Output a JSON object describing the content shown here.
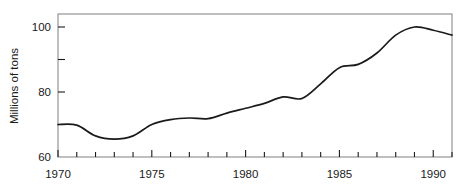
{
  "chart_data": {
    "type": "line",
    "title": "",
    "xlabel": "",
    "ylabel": "Millions of tons",
    "xlim": [
      1970,
      1991
    ],
    "ylim": [
      60,
      104
    ],
    "grid": false,
    "legend": null,
    "x_ticks_major": [
      1970,
      1975,
      1980,
      1985,
      1990
    ],
    "x_tick_labels": [
      "1970",
      "1975",
      "1980",
      "1985",
      "1990"
    ],
    "x_ticks_minor": [
      1971,
      1972,
      1973,
      1974,
      1976,
      1977,
      1978,
      1979,
      1981,
      1982,
      1983,
      1984,
      1986,
      1987,
      1988,
      1989,
      1991
    ],
    "y_ticks_major": [
      60,
      80,
      100
    ],
    "y_tick_labels": [
      "60",
      "80",
      "100"
    ],
    "y_ticks_minor": [
      70,
      90
    ],
    "series": [
      {
        "name": "tonnage",
        "x": [
          1970,
          1971,
          1972,
          1973,
          1974,
          1975,
          1976,
          1977,
          1978,
          1979,
          1980,
          1981,
          1982,
          1983,
          1984,
          1985,
          1986,
          1987,
          1988,
          1989,
          1990,
          1991
        ],
        "values": [
          70.0,
          69.8,
          66.5,
          65.5,
          66.5,
          70.0,
          71.5,
          72.0,
          71.8,
          73.5,
          75.0,
          76.5,
          78.5,
          78.0,
          82.5,
          87.5,
          88.5,
          92.0,
          97.5,
          100.0,
          99.0,
          97.5
        ]
      }
    ]
  },
  "axis": {
    "y_title": "Millions of tons"
  },
  "style": {
    "line_color": "#1a1a1a",
    "frame_color": "#8a8a8a",
    "background": "#ffffff"
  }
}
